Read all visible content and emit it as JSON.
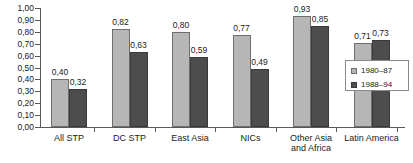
{
  "chart_data": {
    "type": "bar",
    "title": "",
    "subtitle": "",
    "xlabel": "",
    "ylabel": "",
    "ylim": [
      0.0,
      1.0
    ],
    "grid": false,
    "legend_position": "bottom-right",
    "decimal_separator": ",",
    "categories": [
      "All STP",
      "DC STP",
      "East Asia",
      "NICs",
      "Other Asia\nand Africa",
      "Latin America"
    ],
    "y_ticks": [
      0.0,
      0.1,
      0.2,
      0.3,
      0.4,
      0.5,
      0.6,
      0.7,
      0.8,
      0.9,
      1.0
    ],
    "y_tick_labels": [
      "0,00",
      "0,10",
      "0,20",
      "0,30",
      "0,40",
      "0,50",
      "0,60",
      "0,70",
      "0,80",
      "0,90",
      "1,00"
    ],
    "series": [
      {
        "name": "1980–87",
        "color": "#b6b6b6",
        "values": [
          0.4,
          0.82,
          0.8,
          0.77,
          0.93,
          0.71
        ],
        "labels": [
          "0,40",
          "0,82",
          "0,80",
          "0,77",
          "0,93",
          "0,71"
        ]
      },
      {
        "name": "1988–94",
        "color": "#4d4d4d",
        "values": [
          0.32,
          0.63,
          0.59,
          0.49,
          0.85,
          0.73
        ],
        "labels": [
          "0,32",
          "0,63",
          "0,59",
          "0,49",
          "0,85",
          "0,73"
        ]
      }
    ]
  },
  "legend": {
    "entries": [
      {
        "label": "1980–87",
        "swatch": "light"
      },
      {
        "label": "1988–94",
        "swatch": "dark"
      }
    ]
  }
}
